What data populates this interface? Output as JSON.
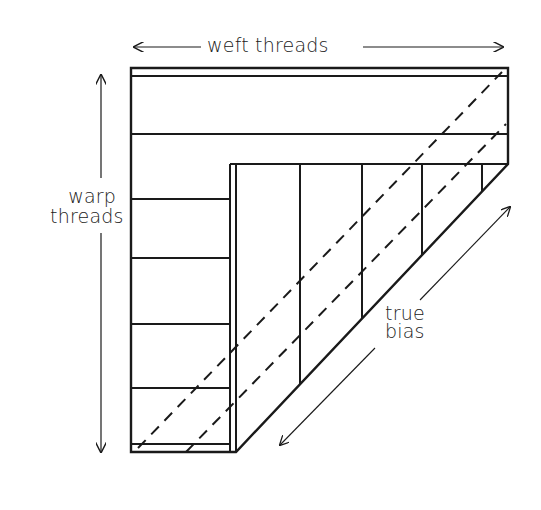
{
  "diagram": {
    "labels": {
      "weft": "weft threads",
      "warp_line1": "warp",
      "warp_line2": "threads",
      "bias_line1": "true",
      "bias_line2": "bias"
    },
    "colors": {
      "ink": "#1a1a1a",
      "background": "#ffffff"
    },
    "elements": {
      "weft_arrow": "double-headed horizontal arrow",
      "warp_arrow": "double-headed vertical arrow",
      "bias_arrow": "double-headed diagonal arrow",
      "fabric": "folded fabric corner with horizontal weft lines and vertical warp lines",
      "bias_cut_lines": "two dashed diagonal lines"
    }
  }
}
